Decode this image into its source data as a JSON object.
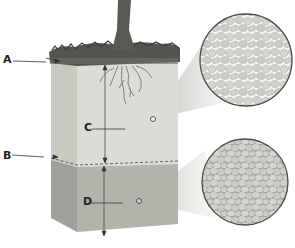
{
  "diagram": {
    "type": "soil-profile-cross-section",
    "labels": [
      {
        "id": "A",
        "text": "A",
        "points_to": "topsoil surface layer (grass/humus)"
      },
      {
        "id": "B",
        "text": "B",
        "points_to": "boundary between upper and lower soil layer"
      },
      {
        "id": "C",
        "text": "C",
        "points_to": "upper soil layer (lighter, coarser particles with gaps)"
      },
      {
        "id": "D",
        "text": "D",
        "points_to": "lower soil layer (darker, tightly packed particles)"
      }
    ],
    "magnifiers": [
      {
        "name": "upper-layer-magnifier",
        "depicts": "loosely packed particles with air spaces"
      },
      {
        "name": "lower-layer-magnifier",
        "depicts": "tightly packed particles"
      }
    ],
    "colors": {
      "upper_layer": "#dcdcd6",
      "upper_side": "#c9c9c2",
      "lower_layer": "#b5b5ae",
      "lower_side": "#a2a29b",
      "grass": "#4a4a44",
      "trunk": "#5a5a55",
      "circle_bg": "#bfbfba",
      "particle": "#d9d9d4"
    }
  }
}
